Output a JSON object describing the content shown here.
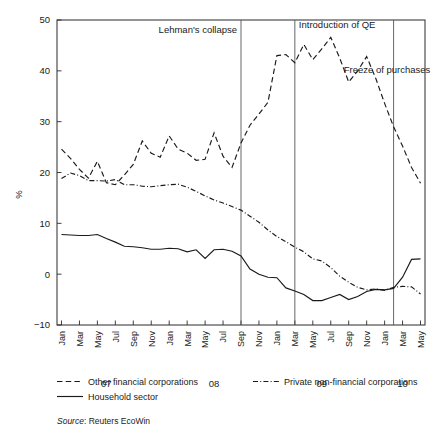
{
  "chart_data": {
    "type": "line",
    "title": "",
    "xlabel": "",
    "ylabel": "%",
    "ylim": [
      -10,
      50
    ],
    "yticks": [
      -10,
      0,
      10,
      20,
      30,
      40,
      50
    ],
    "grid": false,
    "legend_position": "below-axes",
    "source": "Source: Reuters EcoWin",
    "source_prefix": "Source",
    "source_rest": ": Reuters EcoWin",
    "x": [
      "Jan",
      "Feb",
      "Mar",
      "Apr",
      "May",
      "Jun",
      "Jul",
      "Aug",
      "Sep",
      "Oct",
      "Nov",
      "Dec",
      "Jan",
      "Feb",
      "Mar",
      "Apr",
      "May",
      "Jun",
      "Jul",
      "Aug",
      "Sep",
      "Oct",
      "Nov",
      "Dec",
      "Jan",
      "Feb",
      "Mar",
      "Apr",
      "May",
      "Jun",
      "Jul",
      "Aug",
      "Sep",
      "Oct",
      "Nov",
      "Dec",
      "Jan",
      "Feb",
      "Mar",
      "Apr",
      "May"
    ],
    "xtick_labels": [
      "Jan",
      "Mar",
      "May",
      "Jul",
      "Sep",
      "Nov",
      "Jan",
      "Mar",
      "May",
      "Jul",
      "Sep",
      "Nov",
      "Jan",
      "Mar",
      "May",
      "Jul",
      "Sep",
      "Nov",
      "Jan",
      "Mar",
      "May"
    ],
    "year_labels": [
      {
        "label": "07",
        "index": 5
      },
      {
        "label": "08",
        "index": 17
      },
      {
        "label": "09",
        "index": 29
      },
      {
        "label": "10",
        "index": 38
      }
    ],
    "annotations": [
      {
        "text": "Lehman's collapse",
        "index": 20,
        "y": 47.5,
        "align": "right"
      },
      {
        "text": "Introduction of QE",
        "index": 26,
        "y": 48.5,
        "align": "left"
      },
      {
        "text": "Freeze of purchases",
        "index": 31,
        "y": 39.5,
        "align": "left"
      }
    ],
    "vlines": [
      {
        "label": "Lehman's collapse",
        "index": 20
      },
      {
        "label": "Introduction of QE",
        "index": 26
      },
      {
        "label": "Freeze of purchases",
        "index": 37
      }
    ],
    "series": [
      {
        "name": "Other financial corporations",
        "style": "dashed",
        "values": [
          24.6,
          22.8,
          20.6,
          18.9,
          22.2,
          18.0,
          17.6,
          19.5,
          21.6,
          26.2,
          23.8,
          23.0,
          27.2,
          24.6,
          23.8,
          22.4,
          22.6,
          27.8,
          23.2,
          21.0,
          25.8,
          29.3,
          31.5,
          33.8,
          43.0,
          43.2,
          41.6,
          45.2,
          42.2,
          44.3,
          46.6,
          42.5,
          37.8,
          40.0,
          42.8,
          38.6,
          33.6,
          29.0,
          25.2,
          21.0,
          17.9
        ]
      },
      {
        "name": "Private non-financial corporations",
        "style": "dashdot",
        "values": [
          18.8,
          19.9,
          19.4,
          18.4,
          18.4,
          18.3,
          18.6,
          17.6,
          17.6,
          17.3,
          17.2,
          17.4,
          17.6,
          17.7,
          17.1,
          16.3,
          15.4,
          14.6,
          14.0,
          13.3,
          12.6,
          11.4,
          10.2,
          8.7,
          7.4,
          6.4,
          5.3,
          4.4,
          3.0,
          2.6,
          1.3,
          -0.4,
          -1.6,
          -2.6,
          -3.1,
          -2.9,
          -3.2,
          -2.6,
          -2.4,
          -2.5,
          -3.9
        ]
      },
      {
        "name": "Household sector",
        "style": "solid",
        "values": [
          7.8,
          7.7,
          7.6,
          7.6,
          7.8,
          7.0,
          6.3,
          5.5,
          5.4,
          5.2,
          4.9,
          4.9,
          5.1,
          5.0,
          4.4,
          4.8,
          3.1,
          4.8,
          4.9,
          4.5,
          3.6,
          1.0,
          0.0,
          -0.6,
          -0.7,
          -2.7,
          -3.3,
          -4.0,
          -5.2,
          -5.2,
          -4.6,
          -4.0,
          -5.0,
          -4.4,
          -3.4,
          -3.0,
          -3.1,
          -2.8,
          -0.6,
          2.9,
          3.0
        ]
      }
    ],
    "series_tail": {
      "Other financial corporations": [
        17.9,
        9.6,
        5.0,
        4.7
      ],
      "Household sector_end": [
        3.0,
        2.9,
        2.5
      ],
      "Private non-financial corporations_end": [
        -3.9,
        -4.2,
        -4.0
      ]
    }
  },
  "legend": {
    "items": [
      {
        "label": "Other financial corporations",
        "style": "dashed"
      },
      {
        "label": "Private non-financial corporations",
        "style": "dashdot"
      },
      {
        "label": "Household sector",
        "style": "solid"
      }
    ]
  },
  "axis": {
    "y_label": "%"
  }
}
